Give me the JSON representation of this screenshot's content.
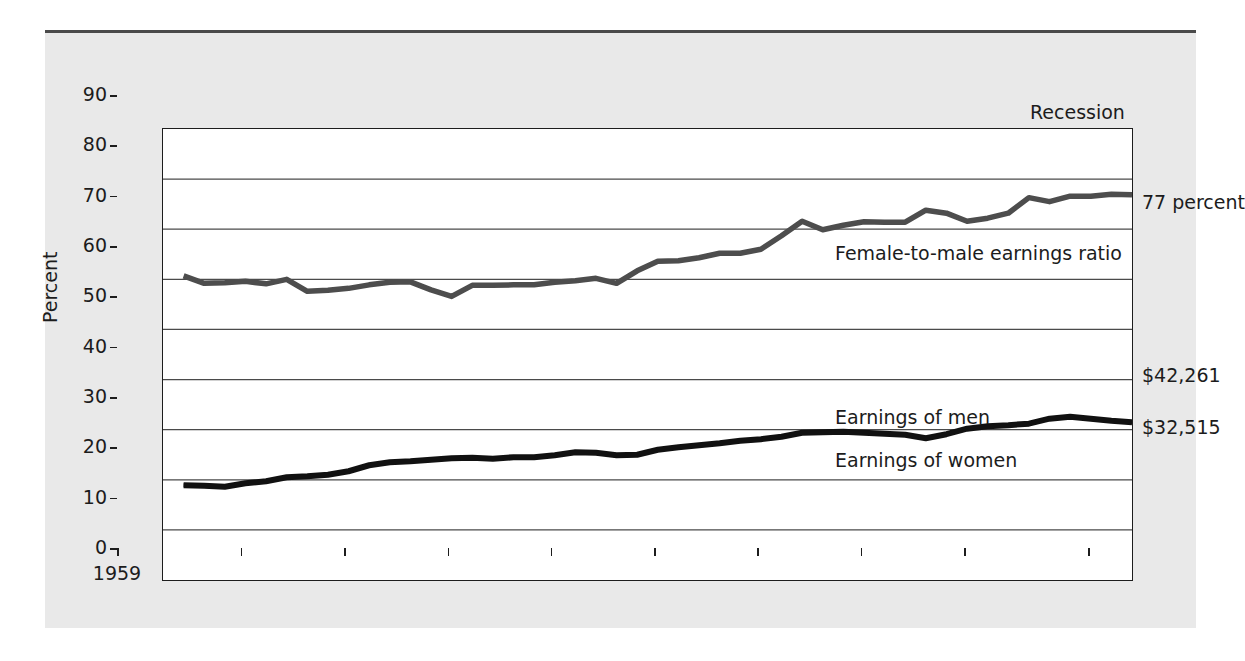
{
  "chart_data": {
    "type": "line",
    "title": "",
    "xlabel": "",
    "ylabel": "Percent",
    "xlim": [
      1959,
      2006
    ],
    "ylim": [
      0,
      90
    ],
    "grid": true,
    "legend_position": "inline-annotations",
    "x_ticks": [
      "1959",
      "1965",
      "1970",
      "1975",
      "1980",
      "1985",
      "1990",
      "1995",
      "2000",
      "2006"
    ],
    "x_tick_values": [
      1959,
      1965,
      1970,
      1975,
      1980,
      1985,
      1990,
      1995,
      2000,
      2006
    ],
    "y_ticks": [
      "0",
      "10",
      "20",
      "30",
      "40",
      "50",
      "60",
      "70",
      "80",
      "90"
    ],
    "y_tick_values": [
      0,
      10,
      20,
      30,
      40,
      50,
      60,
      70,
      80,
      90
    ],
    "x": [
      1960,
      1961,
      1962,
      1963,
      1964,
      1965,
      1966,
      1967,
      1968,
      1969,
      1970,
      1971,
      1972,
      1973,
      1974,
      1975,
      1976,
      1977,
      1978,
      1979,
      1980,
      1981,
      1982,
      1983,
      1984,
      1985,
      1986,
      1987,
      1988,
      1989,
      1990,
      1991,
      1992,
      1993,
      1994,
      1995,
      1996,
      1997,
      1998,
      1999,
      2000,
      2001,
      2002,
      2003,
      2004,
      2005,
      2006
    ],
    "series": [
      {
        "name": "Female-to-male earnings ratio",
        "color": "#4d4d4d",
        "end_label": "77 percent",
        "end_value": 77,
        "values": [
          60.7,
          59.2,
          59.3,
          59.6,
          59.1,
          60.0,
          57.6,
          57.8,
          58.2,
          58.9,
          59.4,
          59.5,
          57.9,
          56.6,
          58.8,
          58.8,
          58.9,
          58.9,
          59.4,
          59.7,
          60.2,
          59.2,
          61.7,
          63.6,
          63.7,
          64.3,
          65.2,
          65.2,
          66.0,
          68.7,
          71.6,
          69.9,
          70.8,
          71.5,
          71.4,
          71.4,
          73.8,
          73.2,
          71.6,
          72.2,
          73.2,
          76.3,
          75.5,
          76.6,
          76.6,
          77.0,
          76.9
        ]
      },
      {
        "name": "Earnings of men",
        "color": "#111111",
        "end_label": "$42,261",
        "end_value": 42261,
        "values": [
          19.0,
          18.9,
          18.7,
          19.4,
          19.8,
          20.6,
          20.8,
          21.1,
          21.8,
          23.0,
          23.6,
          23.8,
          24.1,
          24.4,
          24.5,
          24.3,
          24.6,
          24.6,
          25.0,
          25.6,
          25.5,
          25.0,
          25.1,
          26.1,
          26.6,
          27.0,
          27.4,
          27.9,
          28.2,
          28.7,
          29.5,
          29.6,
          29.7,
          29.5,
          29.3,
          29.1,
          28.4,
          29.2,
          30.3,
          30.8,
          31.0,
          31.3,
          32.3,
          32.7,
          32.3,
          31.9,
          31.6
        ]
      },
      {
        "name": "Earnings of women",
        "color": "#111111",
        "end_label": "$32,515",
        "end_value": 32515,
        "values": [
          18.8,
          18.7,
          18.5,
          19.2,
          19.6,
          20.4,
          20.6,
          20.9,
          21.6,
          22.8,
          23.4,
          23.6,
          23.9,
          24.2,
          24.3,
          24.1,
          24.4,
          24.4,
          24.8,
          25.4,
          25.3,
          24.8,
          24.9,
          25.9,
          26.4,
          26.8,
          27.2,
          27.7,
          28.0,
          28.5,
          29.3,
          29.4,
          29.5,
          29.3,
          29.1,
          28.9,
          28.2,
          29.0,
          30.1,
          30.6,
          30.8,
          31.1,
          32.1,
          32.5,
          32.1,
          31.7,
          31.4
        ]
      }
    ],
    "annotations": [
      {
        "name": "recession",
        "text": "Recession"
      },
      {
        "name": "ratio-end",
        "text": "77 percent"
      },
      {
        "name": "men-end",
        "text": "$42,261"
      },
      {
        "name": "women-end",
        "text": "$32,515"
      },
      {
        "name": "ratio-inline",
        "text": "Female-to-male earnings ratio"
      },
      {
        "name": "men-inline",
        "text": "Earnings of men"
      },
      {
        "name": "women-inline",
        "text": "Earnings of women"
      }
    ]
  },
  "colors": {
    "page_background": "#ffffff",
    "figure_background": "#e9e9e9",
    "plot_background": "#ffffff",
    "rule": "#4a4a4a",
    "axis": "#1d1d1d",
    "gridline": "#4a4a4a",
    "ratio_line": "#4d4d4d",
    "earnings_line": "#111111",
    "text": "#1c1c1c"
  }
}
